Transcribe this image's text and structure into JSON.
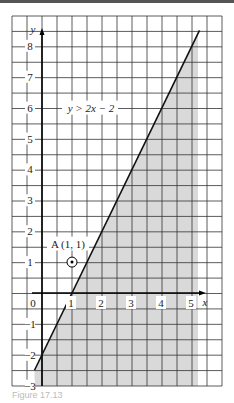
{
  "chart_data": {
    "type": "line",
    "title": "",
    "inequality_label": "y > 2x − 2",
    "line": {
      "equation": "y = 2x - 2",
      "slope": 2,
      "intercept": -2,
      "x_range": [
        -0.25,
        5.25
      ]
    },
    "shaded_region": "below/right of line (region y < 2x - 2), x from line to 5.2",
    "point": {
      "label": "A (1, 1)",
      "x": 1,
      "y": 1,
      "marker": "circled dot"
    },
    "xlabel": "x",
    "ylabel": "y",
    "x_ticks": [
      "0",
      "1",
      "2",
      "3",
      "4",
      "5"
    ],
    "y_ticks": [
      "-3",
      "-2",
      "-1",
      "1",
      "2",
      "3",
      "4",
      "5",
      "6",
      "7",
      "8"
    ],
    "xlim": [
      -1,
      6
    ],
    "ylim": [
      -3,
      9
    ],
    "grid": true
  },
  "labels": {
    "y_axis": "y",
    "x_axis": "x",
    "inequality": "y > 2x − 2",
    "point_a": "A (1, 1)",
    "caption": "Figure 17.13"
  },
  "colors": {
    "grid": "#333333",
    "shade": "#d9d9d9",
    "line": "#111111"
  }
}
